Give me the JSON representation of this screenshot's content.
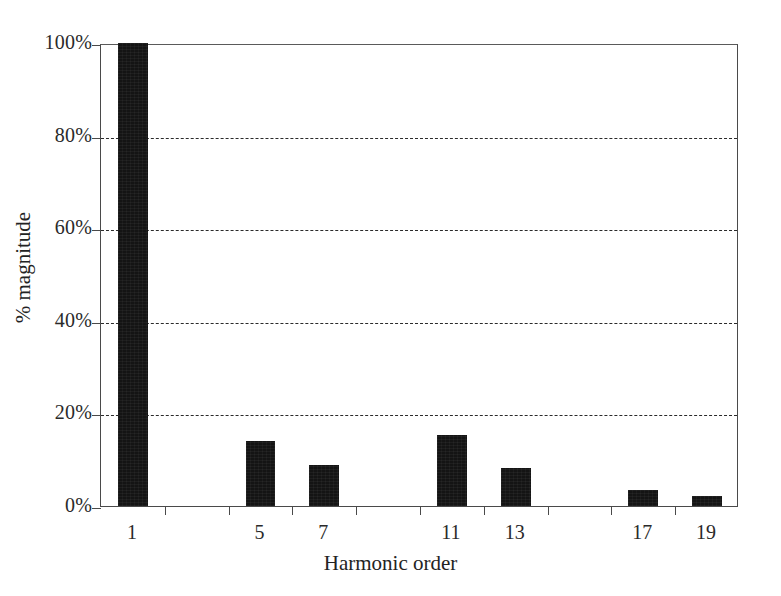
{
  "chart_data": {
    "type": "bar",
    "title": "",
    "xlabel": "Harmonic order",
    "ylabel": "% magnitude",
    "categories": [
      "1",
      "5",
      "7",
      "11",
      "13",
      "17",
      "19"
    ],
    "values": [
      100,
      14,
      8.8,
      15.4,
      8.2,
      3.4,
      2.2
    ],
    "series": [
      {
        "name": "% magnitude",
        "values": [
          100,
          14,
          8.8,
          15.4,
          8.2,
          3.4,
          2.2
        ]
      }
    ],
    "ylim": [
      0,
      100
    ],
    "ytick_values": [
      0,
      20,
      40,
      60,
      80,
      100
    ],
    "ytick_labels": [
      "0%",
      "20%",
      "40%",
      "60%",
      "80%",
      "100%"
    ],
    "xtick_labels": [
      "1",
      "5",
      "7",
      "11",
      "13",
      "17",
      "19"
    ],
    "grid": "horizontal-dashed",
    "gridline_values": [
      20,
      40,
      60,
      80
    ],
    "legend": "none",
    "bar_color": "#141414",
    "axis_color": "#4a4a4a",
    "grid_color": "#2b2b2b",
    "background_color": "#ffffff",
    "slot_count": 10,
    "bar_slots": [
      0,
      2,
      3,
      5,
      6,
      8,
      9
    ]
  }
}
